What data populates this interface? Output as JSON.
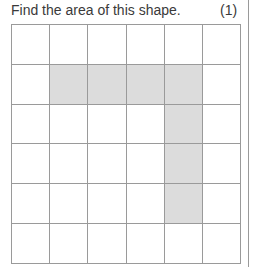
{
  "question": {
    "text": "Find the area of this shape.",
    "marks": "(1)"
  },
  "grid": {
    "rows": 6,
    "cols": 6,
    "shaded_color": "#dcdcdc",
    "shaded_cells": [
      [
        1,
        1
      ],
      [
        1,
        2
      ],
      [
        1,
        3
      ],
      [
        1,
        4
      ],
      [
        2,
        4
      ],
      [
        3,
        4
      ],
      [
        4,
        4
      ]
    ]
  }
}
